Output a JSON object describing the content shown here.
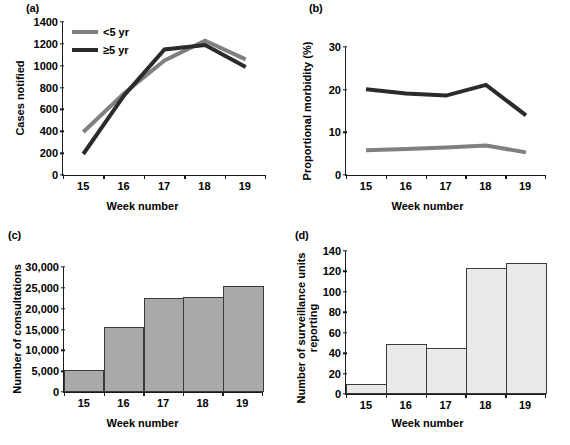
{
  "figure": {
    "panels": [
      "a",
      "b",
      "c",
      "d"
    ],
    "shared_xlabel": "Week number",
    "week_categories": [
      "15",
      "16",
      "17",
      "18",
      "19"
    ],
    "colors": {
      "dark_line": "#2b2b2b",
      "gray_line": "#808080",
      "bar_fill_c": "#a9a9a9",
      "bar_fill_d": "#e9e9e9",
      "bar_stroke": "#3a3a3a",
      "axis": "#1a1a1a"
    }
  },
  "panel_a": {
    "letter": "(a)",
    "ylabel": "Cases notified",
    "xlabel": "Week number",
    "yticks": [
      "0",
      "200",
      "400",
      "600",
      "800",
      "1000",
      "1200",
      "1400"
    ],
    "xticks": [
      "15",
      "16",
      "17",
      "18",
      "19"
    ],
    "legend": [
      {
        "label": "<5 yr",
        "color": "#808080"
      },
      {
        "label": "≥5 yr",
        "color": "#2b2b2b"
      }
    ]
  },
  "panel_b": {
    "letter": "(b)",
    "ylabel": "Proportional morbidity (%)",
    "xlabel": "Week number",
    "yticks": [
      "0",
      "10",
      "20",
      "30"
    ],
    "xticks": [
      "15",
      "16",
      "17",
      "18",
      "19"
    ],
    "legend": [
      {
        "label": "<5 yr",
        "color": "#2b2b2b"
      },
      {
        "label": "≥ 5 yr",
        "color": "#808080"
      }
    ]
  },
  "panel_c": {
    "letter": "(c)",
    "ylabel": "Number of consultations",
    "xlabel": "Week number",
    "yticks": [
      "0",
      "5,000",
      "10,000",
      "15,000",
      "20,000",
      "25,000",
      "30,000"
    ],
    "xticks": [
      "15",
      "16",
      "17",
      "18",
      "19"
    ]
  },
  "panel_d": {
    "letter": "(d)",
    "ylabel": "Number of surveillance units\nreporting",
    "xlabel": "Week number",
    "yticks": [
      "0",
      "20",
      "40",
      "60",
      "80",
      "100",
      "120",
      "140"
    ],
    "xticks": [
      "15",
      "16",
      "17",
      "18",
      "19"
    ]
  },
  "chart_data": [
    {
      "type": "line",
      "panel": "a",
      "title": "(a)",
      "xlabel": "Week number",
      "ylabel": "Cases notified",
      "categories": [
        "15",
        "16",
        "17",
        "18",
        "19"
      ],
      "ylim": [
        0,
        1400
      ],
      "ytick_step": 200,
      "grid": false,
      "legend_position": "upper-left",
      "series": [
        {
          "name": "<5 yr",
          "color": "#808080",
          "values": [
            400,
            750,
            1050,
            1230,
            1060
          ]
        },
        {
          "name": "≥5 yr",
          "color": "#2b2b2b",
          "values": [
            200,
            730,
            1150,
            1190,
            990
          ]
        }
      ]
    },
    {
      "type": "line",
      "panel": "b",
      "title": "(b)",
      "xlabel": "Week number",
      "ylabel": "Proportional morbidity (%)",
      "categories": [
        "15",
        "16",
        "17",
        "18",
        "19"
      ],
      "ylim": [
        0,
        30
      ],
      "ytick_step": 10,
      "grid": false,
      "legend_position": "upper-center",
      "series": [
        {
          "name": "<5 yr",
          "color": "#2b2b2b",
          "values": [
            20.2,
            19.2,
            18.7,
            21.2,
            14.1
          ]
        },
        {
          "name": "≥ 5 yr",
          "color": "#808080",
          "values": [
            6.0,
            6.3,
            6.6,
            7.1,
            5.5
          ]
        }
      ]
    },
    {
      "type": "bar",
      "panel": "c",
      "title": "(c)",
      "xlabel": "Week number",
      "ylabel": "Number of consultations",
      "categories": [
        "15",
        "16",
        "17",
        "18",
        "19"
      ],
      "values": [
        5300,
        15500,
        22300,
        22600,
        25200
      ],
      "ylim": [
        0,
        30000
      ],
      "ytick_step": 5000,
      "grid": false,
      "bar_fill": "#a9a9a9",
      "bar_stroke": "#3a3a3a"
    },
    {
      "type": "bar",
      "panel": "d",
      "title": "(d)",
      "xlabel": "Week number",
      "ylabel": "Number of surveillance units reporting",
      "categories": [
        "15",
        "16",
        "17",
        "18",
        "19"
      ],
      "values": [
        10,
        49,
        45,
        123,
        127
      ],
      "ylim": [
        0,
        140
      ],
      "ytick_step": 20,
      "grid": false,
      "bar_fill": "#e9e9e9",
      "bar_stroke": "#3a3a3a"
    }
  ]
}
